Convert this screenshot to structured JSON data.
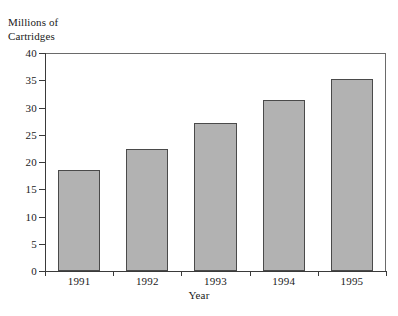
{
  "chart_data": {
    "type": "bar",
    "title": "",
    "categories": [
      "1991",
      "1992",
      "1993",
      "1994",
      "1995"
    ],
    "values": [
      18.5,
      22.3,
      27.2,
      31.3,
      35.2
    ],
    "xlabel": "Year",
    "ylabel": "Millions of\nCartridges",
    "ylim": [
      0,
      40
    ],
    "yticks": [
      0,
      5,
      10,
      15,
      20,
      25,
      30,
      35,
      40
    ],
    "ytick_labels": [
      "0",
      "5",
      "10",
      "15",
      "20",
      "25",
      "30",
      "35",
      "40"
    ],
    "grid": false,
    "legend": false,
    "bar_fill_color": "#b2b2b2",
    "bar_edge_color": "#4a4a4a",
    "axis_color": "#3a3a3a"
  },
  "figure": {
    "top_rule": "",
    "bottom_rule": ""
  }
}
